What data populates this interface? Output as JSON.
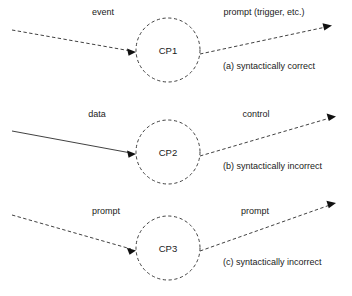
{
  "figure": {
    "title": "",
    "background_color": "#ffffff",
    "stroke_color": "#2b2b2b",
    "text_color": "#1a1a1a"
  },
  "panels": [
    {
      "id": "panel-a",
      "node": {
        "label": "CP1",
        "shape": "circle",
        "border_style": "dashed"
      },
      "incoming_edge": {
        "label": "event",
        "style": "dashed",
        "arrowhead": "filled-triangle"
      },
      "outgoing_edge": {
        "label": "prompt (trigger, etc.)",
        "style": "dashed",
        "arrowhead": "filled-triangle"
      },
      "caption": "(a) syntactically correct"
    },
    {
      "id": "panel-b",
      "node": {
        "label": "CP2",
        "shape": "circle",
        "border_style": "dashed"
      },
      "incoming_edge": {
        "label": "data",
        "style": "solid",
        "arrowhead": "filled-triangle"
      },
      "outgoing_edge": {
        "label": "control",
        "style": "dashed",
        "arrowhead": "filled-triangle"
      },
      "caption": "(b) syntactically incorrect"
    },
    {
      "id": "panel-c",
      "node": {
        "label": "CP3",
        "shape": "circle",
        "border_style": "dashed"
      },
      "incoming_edge": {
        "label": "prompt",
        "style": "dashed",
        "arrowhead": "filled-triangle"
      },
      "outgoing_edge": {
        "label": "prompt",
        "style": "dashed",
        "arrowhead": "filled-triangle"
      },
      "caption": "(c) syntactically incorrect"
    }
  ]
}
